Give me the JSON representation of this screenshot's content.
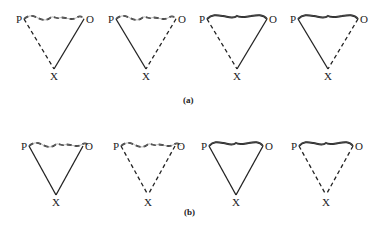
{
  "panels": [
    {
      "label": "(a)",
      "triangles": [
        {
          "P": "P",
          "O": "O",
          "X": "X",
          "top": "thin-dashed-wavy",
          "left": "dashed",
          "right": "solid"
        },
        {
          "P": "P",
          "O": "O",
          "X": "X",
          "top": "thin-dashed-wavy",
          "left": "solid",
          "right": "dashed"
        },
        {
          "P": "P",
          "O": "O",
          "X": "X",
          "top": "thick-wavy",
          "left": "dashed",
          "right": "solid"
        },
        {
          "P": "P",
          "O": "O",
          "X": "X",
          "top": "thick-wavy",
          "left": "solid",
          "right": "dashed"
        }
      ]
    },
    {
      "label": "(b)",
      "triangles": [
        {
          "P": "P",
          "O": "O",
          "X": "X",
          "top": "thin-dashed-wavy",
          "left": "solid",
          "right": "solid"
        },
        {
          "P": "P",
          "O": "O",
          "X": "X",
          "top": "thin-dashed-wavy",
          "left": "dashed",
          "right": "dashed"
        },
        {
          "P": "P",
          "O": "O",
          "X": "X",
          "top": "thick-wavy",
          "left": "solid",
          "right": "solid"
        },
        {
          "P": "P",
          "O": "O",
          "X": "X",
          "top": "thick-wavy",
          "left": "dashed",
          "right": "dashed"
        }
      ]
    }
  ]
}
